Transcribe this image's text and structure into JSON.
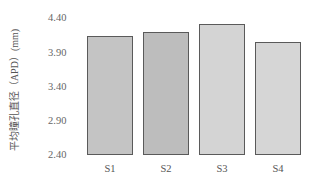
{
  "chart_data": {
    "type": "bar",
    "title": "",
    "xlabel": "",
    "ylabel": "平均瞳孔直径（APD）(mm)",
    "categories": [
      "S1",
      "S2",
      "S3",
      "S4"
    ],
    "values": [
      4.12,
      4.18,
      4.3,
      4.04
    ],
    "ylim": [
      2.4,
      4.4
    ],
    "yticks": [
      "4.40",
      "3.90",
      "3.40",
      "2.90",
      "2.40"
    ],
    "grid": false,
    "legend": null,
    "colors": [
      "#c4c4c4",
      "#bdbdbd",
      "#d4d4d4",
      "#d6d6d6"
    ],
    "border_color": "#5a5a5a"
  }
}
